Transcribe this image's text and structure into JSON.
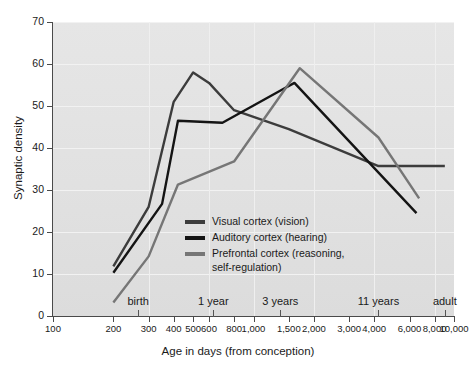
{
  "chart_data": {
    "type": "line",
    "title": "",
    "xlabel": "Age in days (from conception)",
    "ylabel": "Synaptic density",
    "xscale": "log",
    "xlim": [
      100,
      10000
    ],
    "ylim": [
      0,
      70
    ],
    "grid": true,
    "legend_position": "inside-center",
    "y_ticks": [
      0,
      10,
      20,
      30,
      40,
      50,
      60,
      70
    ],
    "x_ticks": [
      100,
      200,
      300,
      400,
      500,
      600,
      800,
      1000,
      1500,
      2000,
      3000,
      4000,
      6000,
      8000,
      10000
    ],
    "x_tick_labels": [
      "100",
      "200",
      "300",
      "400",
      "500",
      "600",
      "800",
      "1,000",
      "1,500",
      "2,000",
      "3,000",
      "4,000",
      "6,000",
      "8,000",
      "10,000"
    ],
    "annotations": [
      {
        "label": "birth",
        "x": 266
      },
      {
        "label": "1 year",
        "x": 630
      },
      {
        "label": "3 years",
        "x": 1360
      },
      {
        "label": "11 years",
        "x": 4200
      },
      {
        "label": "adult",
        "x": 9000
      }
    ],
    "series": [
      {
        "name": "Visual cortex (vision)",
        "color": "#3c3c3c",
        "x": [
          200,
          300,
          400,
          500,
          600,
          800,
          1500,
          4200,
          9000
        ],
        "y": [
          11.8,
          26.0,
          51.0,
          58.0,
          55.5,
          49.0,
          44.5,
          35.7,
          35.7
        ]
      },
      {
        "name": "Auditory cortex (hearing)",
        "color": "#141414",
        "x": [
          200,
          350,
          420,
          700,
          1400,
          1600,
          6500
        ],
        "y": [
          10.3,
          26.7,
          46.5,
          46.0,
          54.0,
          55.5,
          24.5
        ]
      },
      {
        "name": "Prefrontal cortex (reasoning,\nself-regulation)",
        "color": "#767676",
        "x": [
          200,
          300,
          420,
          800,
          1700,
          4200,
          6700
        ],
        "y": [
          3.2,
          14.2,
          31.3,
          36.8,
          59.0,
          42.5,
          28.0
        ]
      }
    ]
  },
  "legend": {
    "items": [
      {
        "label": "Visual cortex (vision)",
        "color": "#3c3c3c"
      },
      {
        "label": "Auditory cortex (hearing)",
        "color": "#141414"
      },
      {
        "label": "Prefrontal cortex (reasoning,\nself-regulation)",
        "color": "#767676"
      }
    ]
  }
}
